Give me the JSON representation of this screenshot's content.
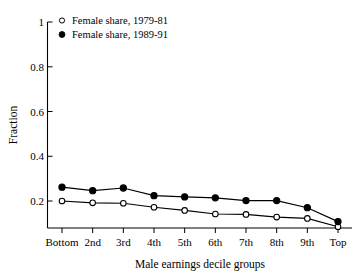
{
  "chart_data": {
    "type": "line",
    "title": "",
    "xlabel": "Male earnings decile groups",
    "ylabel": "Fraction",
    "categories": [
      "Bottom",
      "2nd",
      "3rd",
      "4th",
      "5th",
      "6th",
      "7th",
      "8th",
      "9th",
      "Top"
    ],
    "xtick_labels": [
      "Bottom",
      "2nd",
      "3rd",
      "4th",
      "5th",
      "6th",
      "7th",
      "8th",
      "9th",
      "Top"
    ],
    "ytick_labels": [
      "0.2",
      "0.4",
      "0.6",
      "0.8",
      "1"
    ],
    "ytick_values": [
      0.2,
      0.4,
      0.6,
      0.8,
      1
    ],
    "ylim": [
      0.08,
      1.0
    ],
    "grid": false,
    "legend_position": "top-left",
    "series": [
      {
        "name": "Female share, 1979-81",
        "marker": "open-circle",
        "values": [
          0.2,
          0.192,
          0.19,
          0.172,
          0.158,
          0.142,
          0.14,
          0.128,
          0.122,
          0.085
        ]
      },
      {
        "name": "Female share, 1989-91",
        "marker": "filled-circle",
        "values": [
          0.262,
          0.246,
          0.258,
          0.224,
          0.218,
          0.214,
          0.202,
          0.202,
          0.17,
          0.108
        ]
      }
    ]
  },
  "legend": {
    "entries": [
      {
        "label": "Female share, 1979-81",
        "marker": "open-circle"
      },
      {
        "label": "Female share, 1989-91",
        "marker": "filled-circle"
      }
    ]
  },
  "axes": {
    "y_title": "Fraction",
    "x_title": "Male earnings decile groups"
  },
  "colors": {
    "ink": "#000000",
    "background": "#ffffff"
  }
}
